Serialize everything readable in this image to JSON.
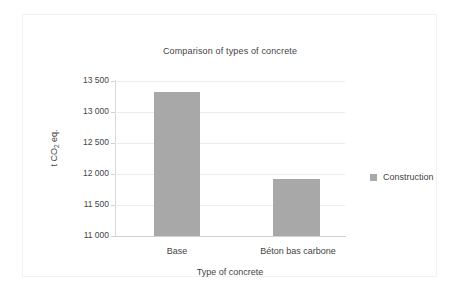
{
  "chart_data": {
    "type": "bar",
    "title": "Comparison of types of concrete",
    "xlabel": "Type of concrete",
    "ylabel": "t CO2 eq.",
    "ylabel_parts": {
      "prefix": "t CO",
      "sub": "2",
      "suffix": " eq."
    },
    "categories": [
      "Base",
      "Béton bas carbone"
    ],
    "series": [
      {
        "name": "Construction",
        "color": "#a8a8a8",
        "values": [
          13320,
          11920
        ]
      }
    ],
    "ylim": [
      11000,
      13500
    ],
    "yticks": [
      11000,
      11500,
      12000,
      12500,
      13000,
      13500
    ],
    "ytick_labels": [
      "11 000",
      "11 500",
      "12 000",
      "12 500",
      "13 000",
      "13 500"
    ],
    "grid": true,
    "legend_position": "right",
    "colors": {
      "bar": "#a8a8a8",
      "gridline": "#ececec",
      "axis": "#d0d0d0",
      "frame": "#f2f2f2",
      "text": "#444444",
      "background": "#ffffff"
    }
  },
  "legend": {
    "items": [
      {
        "label": "Construction",
        "color": "#a8a8a8"
      }
    ]
  }
}
